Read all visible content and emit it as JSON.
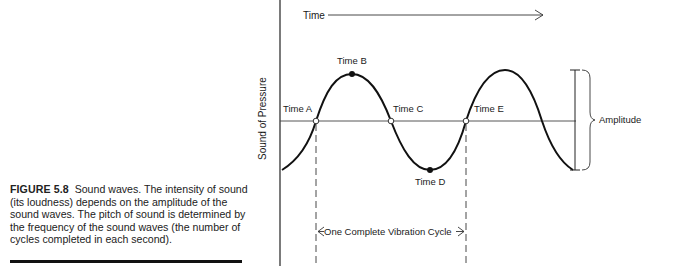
{
  "figure": {
    "number_label": "FIGURE 5.8",
    "caption": "Sound waves. The intensity of sound (its loudness) depends on the amplitude of the sound waves. The pitch of sound is determined by the frequency of the sound waves (the number of cycles completed in each second)."
  },
  "diagram": {
    "time_axis_label": "Time",
    "y_axis_label": "Sound of Pressure",
    "points": {
      "a": "Time A",
      "b": "Time B",
      "c": "Time C",
      "d": "Time D",
      "e": "Time E"
    },
    "amplitude_label": "Amplitude",
    "cycle_label": "One Complete Vibration Cycle"
  },
  "colors": {
    "ink": "#1a1a1a",
    "background": "#ffffff"
  }
}
